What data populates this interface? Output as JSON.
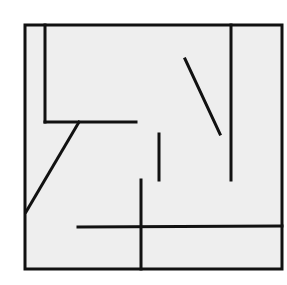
{
  "diagram": {
    "type": "maze-floor-plan",
    "background": "#ffffff",
    "floor_fill": "#eeeeee",
    "stroke_color": "#111111",
    "stroke_width": 3,
    "outer_wall": {
      "x": 25,
      "y": 25,
      "width": 257,
      "height": 244
    },
    "walls": [
      {
        "name": "inner-left-vertical-wall",
        "x1": 45,
        "y1": 25,
        "x2": 45,
        "y2": 122
      },
      {
        "name": "inner-upper-horizontal-wall",
        "x1": 45,
        "y1": 122,
        "x2": 136,
        "y2": 122
      },
      {
        "name": "left-diagonal-wall",
        "x1": 79,
        "y1": 122,
        "x2": 26,
        "y2": 212
      },
      {
        "name": "upper-right-diagonal-wall",
        "x1": 185,
        "y1": 59,
        "x2": 220,
        "y2": 134
      },
      {
        "name": "right-vertical-wall",
        "x1": 231,
        "y1": 25,
        "x2": 231,
        "y2": 180
      },
      {
        "name": "short-center-vertical-wall",
        "x1": 159,
        "y1": 134,
        "x2": 159,
        "y2": 180
      },
      {
        "name": "lower-center-vertical-wall",
        "x1": 141,
        "y1": 180,
        "x2": 141,
        "y2": 269
      },
      {
        "name": "lower-horizontal-wall",
        "x1": 78,
        "y1": 227,
        "x2": 282,
        "y2": 226
      }
    ]
  }
}
